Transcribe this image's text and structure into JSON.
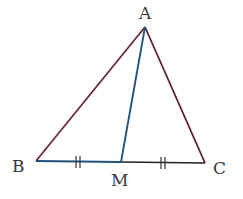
{
  "diagram": {
    "type": "triangle-with-median",
    "points": {
      "A": {
        "label": "A",
        "x": 145,
        "y": 27,
        "label_x": 139,
        "label_y": 19
      },
      "B": {
        "label": "B",
        "x": 36,
        "y": 161,
        "label_x": 12,
        "label_y": 172
      },
      "C": {
        "label": "C",
        "x": 205,
        "y": 163,
        "label_x": 213,
        "label_y": 174
      },
      "M": {
        "label": "M",
        "x": 121,
        "y": 162,
        "label_x": 111,
        "label_y": 186
      }
    },
    "segments": [
      {
        "name": "AB",
        "color": "#6a2838"
      },
      {
        "name": "AC",
        "color": "#5a2030"
      },
      {
        "name": "AM",
        "color": "#1f4f7a"
      },
      {
        "name": "BM",
        "color": "#1f4f7a"
      },
      {
        "name": "MC",
        "color": "#222222"
      }
    ],
    "equal_marks": [
      "BM",
      "MC"
    ]
  }
}
